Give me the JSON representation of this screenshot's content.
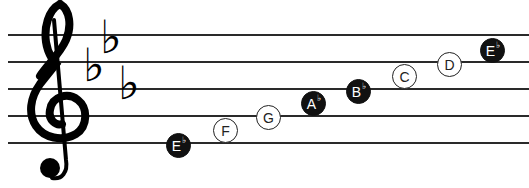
{
  "staff": {
    "clef": "treble-clef",
    "key_signature": {
      "name": "E-flat major",
      "flats": [
        "B",
        "E",
        "A"
      ],
      "flat_glyph": "♭"
    },
    "line_y": [
      35,
      62,
      89,
      116,
      143
    ]
  },
  "scale": {
    "title": "E♭ major scale",
    "notes": [
      {
        "letter": "E",
        "accidental": "♭",
        "style": "filled",
        "x": 178,
        "y": 145
      },
      {
        "letter": "F",
        "accidental": "",
        "style": "outline",
        "x": 225,
        "y": 130
      },
      {
        "letter": "G",
        "accidental": "",
        "style": "outline",
        "x": 268,
        "y": 117
      },
      {
        "letter": "A",
        "accidental": "♭",
        "style": "filled",
        "x": 313,
        "y": 103
      },
      {
        "letter": "B",
        "accidental": "♭",
        "style": "filled",
        "x": 358,
        "y": 91
      },
      {
        "letter": "C",
        "accidental": "",
        "style": "outline",
        "x": 404,
        "y": 76
      },
      {
        "letter": "D",
        "accidental": "",
        "style": "outline",
        "x": 449,
        "y": 64
      },
      {
        "letter": "E",
        "accidental": "♭",
        "style": "filled",
        "x": 492,
        "y": 50
      }
    ]
  },
  "colors": {
    "line": "#2a2a2a",
    "filled_note": "#111111",
    "outline_note_bg": "#ffffff",
    "text_on_filled": "#ffffff"
  }
}
